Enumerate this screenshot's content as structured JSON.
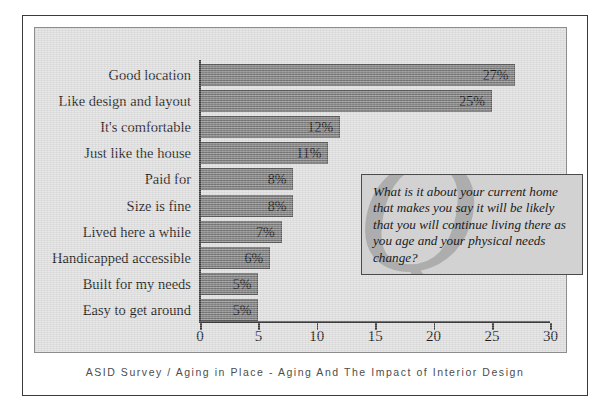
{
  "chart_data": {
    "type": "bar",
    "orientation": "horizontal",
    "title": "",
    "xlabel": "",
    "ylabel": "",
    "xlim": [
      0,
      30
    ],
    "grid": false,
    "legend": null,
    "categories": [
      "Good location",
      "Like design and layout",
      "It's comfortable",
      "Just like the house",
      "Paid for",
      "Size is fine",
      "Lived here a while",
      "Handicapped accessible",
      "Built for my needs",
      "Easy to get around"
    ],
    "values": [
      27,
      25,
      12,
      11,
      8,
      8,
      7,
      6,
      5,
      5
    ],
    "value_labels": [
      "27%",
      "25%",
      "12%",
      "11%",
      "8%",
      "8%",
      "7%",
      "6%",
      "5%",
      "5%"
    ],
    "x_ticks": [
      0,
      5,
      10,
      15,
      20,
      25,
      30
    ],
    "x_tick_labels": [
      "0",
      "5",
      "10",
      "15",
      "20",
      "25",
      "30"
    ],
    "bar_color": "#767676",
    "panel_color": "#dedede"
  },
  "callout": {
    "text": "What is it about your current home that makes you say it will be likely that you will continue living there as you age and your physical needs change?",
    "watermark": "Q"
  },
  "footer": {
    "text": "ASID Survey / Aging in Place - Aging And The Impact of Interior Design"
  }
}
